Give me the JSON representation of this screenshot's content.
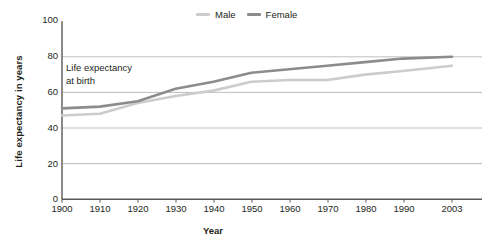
{
  "chart_data": {
    "type": "line",
    "title": "",
    "xlabel": "Year",
    "ylabel": "Life expectancy in years",
    "annotation": {
      "line1": "Life expectancy",
      "line2": "at birth"
    },
    "x": [
      1900,
      1910,
      1920,
      1930,
      1940,
      1950,
      1960,
      1970,
      1980,
      1990,
      2003
    ],
    "categories": [
      "1900",
      "1910",
      "1920",
      "1930",
      "1940",
      "1950",
      "1960",
      "1970",
      "1980",
      "1990",
      "2003"
    ],
    "yticks": [
      0,
      20,
      40,
      60,
      80,
      100
    ],
    "ylim": [
      0,
      100
    ],
    "xlim": [
      1900,
      2003
    ],
    "grid": true,
    "grid_axis": "y",
    "legend_position": "top-center",
    "series": [
      {
        "name": "Male",
        "color": "#cccccc",
        "values": [
          47,
          48,
          54,
          58,
          61,
          66,
          67,
          67,
          70,
          72,
          75
        ]
      },
      {
        "name": "Female",
        "color": "#8c8c8c",
        "values": [
          51,
          52,
          55,
          62,
          66,
          71,
          73,
          75,
          77,
          79,
          80
        ]
      }
    ]
  },
  "legend": {
    "items": [
      {
        "label": "Male",
        "color": "#cccccc"
      },
      {
        "label": "Female",
        "color": "#8c8c8c"
      }
    ]
  },
  "axes": {
    "y_title": "Life expectancy in years",
    "x_title": "Year",
    "y_tick_labels": [
      "100",
      "80",
      "60",
      "40",
      "20",
      "0"
    ],
    "x_tick_labels": [
      "1900",
      "1910",
      "1920",
      "1930",
      "1940",
      "1950",
      "1960",
      "1970",
      "1980",
      "1990",
      "2003"
    ]
  },
  "colors": {
    "axis": "#4d4d4d",
    "grid": "#bfbfbf",
    "text": "#231f20",
    "background": "#ffffff"
  }
}
